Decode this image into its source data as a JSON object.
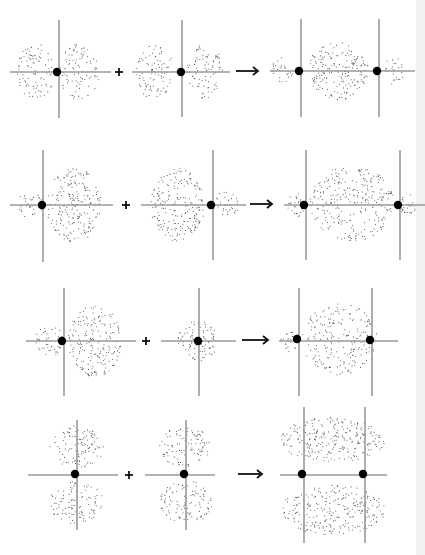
{
  "figure": {
    "colors": {
      "background": "#ffffff",
      "axis": "#9a9a9a",
      "nucleus": "#000000",
      "dots": "#555555",
      "operator": "#111111",
      "edge_strip": "#f1f1f1"
    },
    "rows": [
      {
        "name": "p-p-sigma",
        "items": [
          {
            "type": "orbital",
            "hline": [
              10,
              111,
              72
            ],
            "vlines": [
              [
                59,
                20,
                118
              ]
            ],
            "nuclei": [
              [
                57,
                72
              ]
            ],
            "lobes": [
              [
                36,
                72,
                19,
                28,
                90
              ],
              [
                79,
                72,
                20,
                28,
                90
              ]
            ]
          },
          {
            "type": "plus",
            "x": 119,
            "y": 72
          },
          {
            "type": "orbital",
            "hline": [
              132,
              230,
              72
            ],
            "vlines": [
              [
                182,
                20,
                117
              ]
            ],
            "nuclei": [
              [
                181,
                72
              ]
            ],
            "lobes": [
              [
                155,
                72,
                19,
                28,
                90
              ],
              [
                205,
                72,
                18,
                28,
                90
              ]
            ]
          },
          {
            "type": "arrow",
            "x1": 236,
            "x2": 258,
            "y": 71
          },
          {
            "type": "orbital",
            "hline": [
              270,
              415,
              71
            ],
            "vlines": [
              [
                301,
                19,
                117
              ],
              [
                379,
                19,
                117
              ]
            ],
            "nuclei": [
              [
                299,
                71
              ],
              [
                377,
                71
              ]
            ],
            "lobes": [
              [
                282,
                71,
                11,
                14,
                28
              ],
              [
                338,
                71,
                31,
                29,
                190
              ],
              [
                394,
                71,
                10,
                14,
                28
              ]
            ]
          }
        ]
      },
      {
        "name": "s-p-hybrid-sigma",
        "items": [
          {
            "type": "orbital",
            "hline": [
              10,
              113,
              205
            ],
            "vlines": [
              [
                43,
                150,
                262
              ]
            ],
            "nuclei": [
              [
                42,
                205
              ]
            ],
            "lobes": [
              [
                29,
                205,
                14,
                14,
                35
              ],
              [
                74,
                205,
                28,
                37,
                210
              ]
            ]
          },
          {
            "type": "plus",
            "x": 126,
            "y": 205
          },
          {
            "type": "orbital",
            "hline": [
              141,
              246,
              205
            ],
            "vlines": [
              [
                213,
                150,
                260
              ]
            ],
            "nuclei": [
              [
                211,
                205
              ]
            ],
            "lobes": [
              [
                178,
                205,
                27,
                37,
                210
              ],
              [
                226,
                205,
                13,
                13,
                35
              ]
            ]
          },
          {
            "type": "arrow",
            "x1": 250,
            "x2": 272,
            "y": 204
          },
          {
            "type": "orbital",
            "hline": [
              284,
              425,
              205
            ],
            "vlines": [
              [
                306,
                150,
                260
              ],
              [
                400,
                150,
                260
              ]
            ],
            "nuclei": [
              [
                304,
                205
              ],
              [
                398,
                205
              ]
            ],
            "lobes": [
              [
                296,
                205,
                9,
                12,
                28
              ],
              [
                352,
                203,
                42,
                38,
                280
              ],
              [
                408,
                205,
                9,
                12,
                28
              ]
            ]
          }
        ]
      },
      {
        "name": "sp-s-sigma",
        "items": [
          {
            "type": "orbital",
            "hline": [
              26,
              136,
              341
            ],
            "vlines": [
              [
                64,
                288,
                396
              ]
            ],
            "nuclei": [
              [
                62,
                341
              ]
            ],
            "lobes": [
              [
                50,
                341,
                15,
                15,
                45
              ],
              [
                95,
                341,
                27,
                36,
                200
              ]
            ]
          },
          {
            "type": "plus",
            "x": 146,
            "y": 341
          },
          {
            "type": "orbital",
            "hline": [
              161,
              236,
              341
            ],
            "vlines": [
              [
                199,
                288,
                396
              ]
            ],
            "nuclei": [
              [
                198,
                341
              ]
            ],
            "lobes": [
              [
                198,
                341,
                20,
                20,
                90
              ]
            ]
          },
          {
            "type": "arrow",
            "x1": 242,
            "x2": 268,
            "y": 340
          },
          {
            "type": "orbital",
            "hline": [
              279,
              398,
              341
            ],
            "vlines": [
              [
                299,
                288,
                396
              ],
              [
                372,
                288,
                396
              ]
            ],
            "nuclei": [
              [
                297,
                339
              ],
              [
                370,
                340
              ]
            ],
            "lobes": [
              [
                289,
                341,
                9,
                11,
                22
              ],
              [
                340,
                339,
                38,
                36,
                220
              ]
            ]
          }
        ]
      },
      {
        "name": "p-p-pi",
        "items": [
          {
            "type": "orbital",
            "hline": [
              28,
              118,
              475
            ],
            "vlines": [
              [
                77,
                420,
                530
              ]
            ],
            "nuclei": [
              [
                75,
                474
              ]
            ],
            "lobes": [
              [
                77,
                447,
                27,
                21,
                110
              ],
              [
                76,
                502,
                27,
                22,
                110
              ]
            ]
          },
          {
            "type": "plus",
            "x": 129,
            "y": 475
          },
          {
            "type": "orbital",
            "hline": [
              145,
              215,
              475
            ],
            "vlines": [
              [
                186,
                420,
                530
              ]
            ],
            "nuclei": [
              [
                184,
                474
              ]
            ],
            "lobes": [
              [
                185,
                447,
                26,
                21,
                110
              ],
              [
                186,
                502,
                26,
                22,
                110
              ]
            ]
          },
          {
            "type": "arrow",
            "x1": 238,
            "x2": 262,
            "y": 474
          },
          {
            "type": "orbital",
            "hline": [
              280,
              387,
              475
            ],
            "vlines": [
              [
                304,
                407,
                543
              ],
              [
                365,
                407,
                543
              ]
            ],
            "nuclei": [
              [
                302,
                474
              ],
              [
                363,
                474
              ]
            ],
            "lobes": [
              [
                333,
                440,
                52,
                23,
                260
              ],
              [
                333,
                510,
                52,
                25,
                270
              ]
            ]
          }
        ]
      }
    ]
  }
}
